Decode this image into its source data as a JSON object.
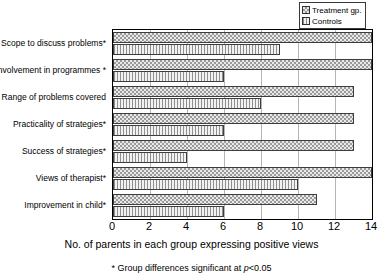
{
  "chart_data": {
    "type": "bar",
    "orientation": "horizontal",
    "title": "",
    "xlabel": "No. of parents in each group expressing positive views",
    "ylabel": "",
    "xlim": [
      0,
      14
    ],
    "xticks": [
      0,
      2,
      4,
      6,
      8,
      10,
      12,
      14
    ],
    "grid": true,
    "legend_position": "top-right",
    "categories": [
      "Scope to discuss problems*",
      "Involvement in programmes *",
      "Range of problems covered",
      "Practicality of strategies*",
      "Success of strategies*",
      "Views of therapist*",
      "Improvement in child*"
    ],
    "series": [
      {
        "name": "Treatment gp.",
        "pattern": "checkerboard",
        "values": [
          14,
          14,
          13,
          13,
          13,
          14,
          11
        ]
      },
      {
        "name": "Controls",
        "pattern": "vertical-lines",
        "values": [
          9,
          6,
          8,
          6,
          4,
          10,
          6
        ]
      }
    ],
    "footnote": "* Group differences significant at p<0.05"
  },
  "legend": {
    "items": [
      {
        "label": "Treatment gp.",
        "pattern": "checkerboard"
      },
      {
        "label": "Controls",
        "pattern": "vertical-lines"
      }
    ]
  },
  "footnote": {
    "prefix": "* Group differences significant at ",
    "italic": "p",
    "suffix": "<0.05"
  },
  "colors": {
    "axis": "#000000",
    "grid": "#b5b5b5",
    "bar_outline": "#3d3d3d",
    "pattern_ink": "#9a9a9a",
    "background": "#ffffff"
  }
}
